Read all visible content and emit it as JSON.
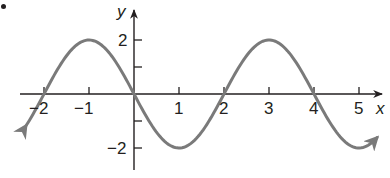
{
  "chart_data": {
    "type": "line",
    "title": "",
    "function": "y = -2 sin(pi x / 2)",
    "xlabel": "x",
    "ylabel": "y",
    "xlim": [
      -2.4,
      5.4
    ],
    "ylim": [
      -2.4,
      2.4
    ],
    "x_ticks": [
      -2,
      -1,
      1,
      2,
      3,
      4,
      5
    ],
    "x_tick_labels": [
      "−2",
      "−1",
      "1",
      "2",
      "3",
      "4",
      "5"
    ],
    "y_ticks": [
      -2,
      -1,
      1,
      2
    ],
    "y_tick_labels": [
      "−2",
      "2"
    ],
    "grid": false,
    "legend": null,
    "series": [
      {
        "name": "curve",
        "x": [
          -2.4,
          -2,
          -1.5,
          -1,
          -0.5,
          0,
          0.5,
          1,
          1.5,
          2,
          2.5,
          3,
          3.5,
          4,
          4.5,
          5,
          5.4
        ],
        "values": [
          -1.18,
          0,
          1.41,
          2,
          1.41,
          0,
          -1.41,
          -2,
          -1.41,
          0,
          1.41,
          2,
          1.41,
          0,
          -1.41,
          -2,
          -1.9
        ],
        "key_points": {
          "maxima": [
            [
              -1,
              2
            ],
            [
              3,
              2
            ]
          ],
          "minima": [
            [
              1,
              -2
            ],
            [
              5,
              -2
            ]
          ],
          "zeros": [
            [
              -2,
              0
            ],
            [
              0,
              0
            ],
            [
              2,
              0
            ],
            [
              4,
              0
            ]
          ]
        },
        "arrows_at_ends": true
      }
    ],
    "colors": {
      "curve": "#7a7a7a",
      "axes": "#231f20"
    }
  },
  "labels": {
    "problem_marker": "•",
    "x_axis": "x",
    "y_axis": "y",
    "x_ticks": [
      "−2",
      "−1",
      "1",
      "2",
      "3",
      "4",
      "5"
    ],
    "y_ticks": [
      "2",
      "−2"
    ]
  }
}
